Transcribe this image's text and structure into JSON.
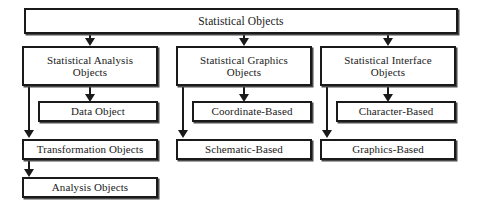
{
  "diagram": {
    "type": "tree-diagram",
    "colors": {
      "box_border": "#1a1a1a",
      "box_fill": "#ffffff",
      "connector": "#1a1a1a",
      "background": "#ffffff"
    },
    "nodes": {
      "root": {
        "label": "Statistical Objects"
      },
      "analysis_branch": {
        "label": "Statistical Analysis\nObjects"
      },
      "graphics_branch": {
        "label": "Statistical Graphics\nObjects"
      },
      "interface_branch": {
        "label": "Statistical Interface\nObjects"
      },
      "data_object": {
        "label": "Data Object"
      },
      "coordinate_based": {
        "label": "Coordinate-Based"
      },
      "character_based": {
        "label": "Character-Based"
      },
      "transformation_objects": {
        "label": "Transformation Objects"
      },
      "schematic_based": {
        "label": "Schematic-Based"
      },
      "graphics_based": {
        "label": "Graphics-Based"
      },
      "analysis_objects": {
        "label": "Analysis Objects"
      }
    },
    "edges": [
      {
        "from": "root",
        "to": "analysis_branch"
      },
      {
        "from": "root",
        "to": "graphics_branch"
      },
      {
        "from": "root",
        "to": "interface_branch"
      },
      {
        "from": "analysis_branch",
        "to": "data_object"
      },
      {
        "from": "analysis_branch",
        "to": "transformation_objects"
      },
      {
        "from": "graphics_branch",
        "to": "coordinate_based"
      },
      {
        "from": "graphics_branch",
        "to": "schematic_based"
      },
      {
        "from": "interface_branch",
        "to": "character_based"
      },
      {
        "from": "interface_branch",
        "to": "graphics_based"
      },
      {
        "from": "transformation_objects",
        "to": "analysis_objects"
      }
    ]
  }
}
